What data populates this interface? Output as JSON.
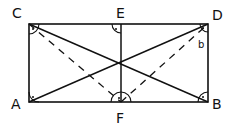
{
  "diagram": {
    "type": "geometry-rectangle",
    "stroke_color": "#111111",
    "background": "#ffffff",
    "points": {
      "A": {
        "label": "A",
        "x": 29,
        "y": 102
      },
      "B": {
        "label": "B",
        "x": 208,
        "y": 102
      },
      "C": {
        "label": "C",
        "x": 29,
        "y": 24
      },
      "D": {
        "label": "D",
        "x": 208,
        "y": 24
      },
      "E": {
        "label": "E",
        "x": 121,
        "y": 24
      },
      "F": {
        "label": "F",
        "x": 121,
        "y": 102
      }
    },
    "angle_label": "b",
    "solid_segments": [
      "AB",
      "BD",
      "DC",
      "CA",
      "EF",
      "AD",
      "CB"
    ],
    "dashed_segments": [
      "CF",
      "FD"
    ],
    "right_angle_marks": [
      "A",
      "B",
      "C",
      "D",
      "E",
      "F"
    ]
  }
}
